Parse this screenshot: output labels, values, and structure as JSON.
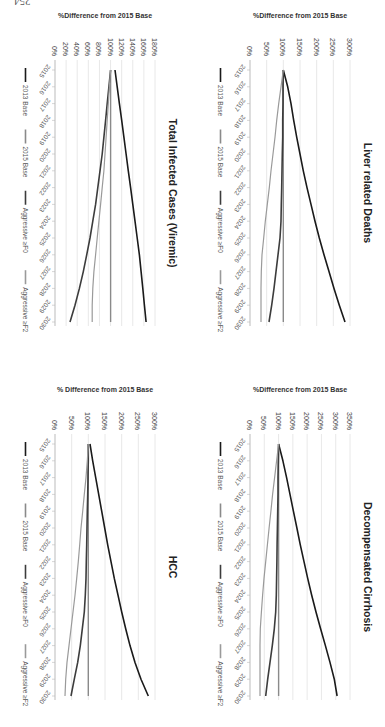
{
  "page": {
    "number": "254"
  },
  "legend": [
    "2013 Base",
    "2015 Base",
    "Aggressive ≥F0",
    "Aggressive ≥F2"
  ],
  "series_colors": [
    "#1a1a1a",
    "#8a8a8a",
    "#3c3c3c",
    "#9a9a9a"
  ],
  "chart_data": [
    {
      "type": "line",
      "title": "Total Infected Cases (Viremic)",
      "ylabel": "%Difference from 2015 Base",
      "xlabel": "",
      "ylim": [
        0,
        180
      ],
      "yticks": [
        0,
        20,
        40,
        60,
        80,
        100,
        120,
        140,
        160,
        180
      ],
      "ytick_labels": [
        "0%",
        "20%",
        "40%",
        "60%",
        "80%",
        "100%",
        "120%",
        "140%",
        "160%",
        "180%"
      ],
      "x": [
        2015,
        2016,
        2017,
        2018,
        2019,
        2020,
        2021,
        2022,
        2023,
        2024,
        2025,
        2026,
        2027,
        2028,
        2029,
        2030
      ],
      "grid": true,
      "legend_position": "bottom",
      "series": [
        {
          "name": "2013 Base",
          "values": [
            108,
            112,
            116,
            120,
            124,
            128,
            132,
            136,
            140,
            144,
            148,
            152,
            155,
            158,
            161,
            164
          ]
        },
        {
          "name": "2015 Base",
          "values": [
            100,
            100,
            100,
            100,
            100,
            100,
            100,
            100,
            100,
            100,
            100,
            100,
            100,
            100,
            100,
            100
          ]
        },
        {
          "name": "Aggressive ≥F0",
          "values": [
            100,
            97,
            94,
            91,
            88,
            85,
            81,
            77,
            73,
            68,
            63,
            57,
            51,
            44,
            36,
            27
          ]
        },
        {
          "name": "Aggressive ≥F2",
          "values": [
            100,
            98,
            96,
            94,
            92,
            90,
            88,
            85,
            82,
            79,
            76,
            73,
            70,
            68,
            67,
            67
          ]
        }
      ]
    },
    {
      "type": "line",
      "title": "HCC",
      "ylabel": "% Difference from 2015 Base",
      "xlabel": "",
      "ylim": [
        0,
        300
      ],
      "yticks": [
        0,
        50,
        100,
        150,
        200,
        250,
        300
      ],
      "ytick_labels": [
        "0%",
        "50%",
        "100%",
        "150%",
        "200%",
        "250%",
        "300%"
      ],
      "x": [
        2015,
        2016,
        2017,
        2018,
        2019,
        2020,
        2021,
        2022,
        2023,
        2024,
        2025,
        2026,
        2027,
        2028,
        2029,
        2030
      ],
      "grid": true,
      "legend_position": "bottom",
      "series": [
        {
          "name": "2013 Base",
          "values": [
            105,
            113,
            122,
            131,
            140,
            149,
            158,
            168,
            178,
            189,
            200,
            212,
            225,
            240,
            258,
            280
          ]
        },
        {
          "name": "2015 Base",
          "values": [
            100,
            100,
            100,
            100,
            100,
            100,
            100,
            100,
            100,
            100,
            100,
            100,
            100,
            100,
            100,
            100
          ]
        },
        {
          "name": "Aggressive ≥F0",
          "values": [
            100,
            100,
            99,
            98,
            97,
            96,
            95,
            94,
            93,
            91,
            88,
            82,
            76,
            68,
            58,
            48
          ]
        },
        {
          "name": "Aggressive ≥F2",
          "values": [
            100,
            97,
            93,
            88,
            83,
            78,
            74,
            70,
            65,
            60,
            54,
            48,
            42,
            36,
            32,
            30
          ]
        }
      ]
    },
    {
      "type": "line",
      "title": "Liver related Deaths",
      "ylabel": "%Difference from 2015 Base",
      "xlabel": "",
      "ylim": [
        0,
        300
      ],
      "yticks": [
        0,
        50,
        100,
        150,
        200,
        250,
        300
      ],
      "ytick_labels": [
        "0%",
        "50%",
        "100%",
        "150%",
        "200%",
        "250%",
        "300%"
      ],
      "x": [
        2015,
        2016,
        2017,
        2018,
        2019,
        2020,
        2021,
        2022,
        2023,
        2024,
        2025,
        2026,
        2027,
        2028,
        2029,
        2030
      ],
      "grid": true,
      "legend_position": "bottom",
      "series": [
        {
          "name": "2013 Base",
          "values": [
            100,
            113,
            123,
            131,
            140,
            150,
            160,
            171,
            183,
            195,
            208,
            222,
            237,
            252,
            268,
            285
          ]
        },
        {
          "name": "2015 Base",
          "values": [
            100,
            100,
            100,
            100,
            100,
            100,
            100,
            100,
            100,
            100,
            100,
            100,
            100,
            100,
            100,
            100
          ]
        },
        {
          "name": "Aggressive ≥F0",
          "values": [
            100,
            99,
            99,
            98,
            98,
            97,
            96,
            95,
            94,
            93,
            90,
            84,
            78,
            72,
            65,
            57
          ]
        },
        {
          "name": "Aggressive ≥F2",
          "values": [
            100,
            93,
            86,
            80,
            75,
            69,
            63,
            58,
            52,
            46,
            41,
            36,
            34,
            33,
            33,
            33
          ]
        }
      ]
    },
    {
      "type": "line",
      "title": "Decompensated Cirrhosis",
      "ylabel": "%Difference from 2015 Base",
      "xlabel": "",
      "ylim": [
        0,
        350
      ],
      "yticks": [
        0,
        50,
        100,
        150,
        200,
        250,
        300,
        350
      ],
      "ytick_labels": [
        "0%",
        "50%",
        "100%",
        "150%",
        "200%",
        "250%",
        "300%",
        "350%"
      ],
      "x": [
        2015,
        2016,
        2017,
        2018,
        2019,
        2020,
        2021,
        2022,
        2023,
        2024,
        2025,
        2026,
        2027,
        2028,
        2029,
        2030
      ],
      "grid": true,
      "legend_position": "bottom",
      "series": [
        {
          "name": "2013 Base",
          "values": [
            100,
            115,
            128,
            140,
            152,
            164,
            176,
            189,
            202,
            216,
            231,
            247,
            264,
            280,
            295,
            305
          ]
        },
        {
          "name": "2015 Base",
          "values": [
            100,
            100,
            100,
            100,
            100,
            100,
            100,
            100,
            100,
            100,
            100,
            100,
            100,
            100,
            100,
            100
          ]
        },
        {
          "name": "Aggressive ≥F0",
          "values": [
            100,
            99,
            98,
            98,
            97,
            96,
            95,
            94,
            93,
            92,
            90,
            85,
            78,
            70,
            62,
            55
          ]
        },
        {
          "name": "Aggressive ≥F2",
          "values": [
            100,
            93,
            86,
            79,
            73,
            67,
            61,
            55,
            49,
            44,
            40,
            36,
            35,
            35,
            35,
            35
          ]
        }
      ]
    }
  ],
  "layout": {
    "panels": [
      {
        "chart": 0,
        "left": 183,
        "top": 8
      },
      {
        "chart": 1,
        "left": 183,
        "top": 382
      },
      {
        "chart": 2,
        "left": 378,
        "top": 8
      },
      {
        "chart": 3,
        "left": 378,
        "top": 382
      }
    ]
  }
}
